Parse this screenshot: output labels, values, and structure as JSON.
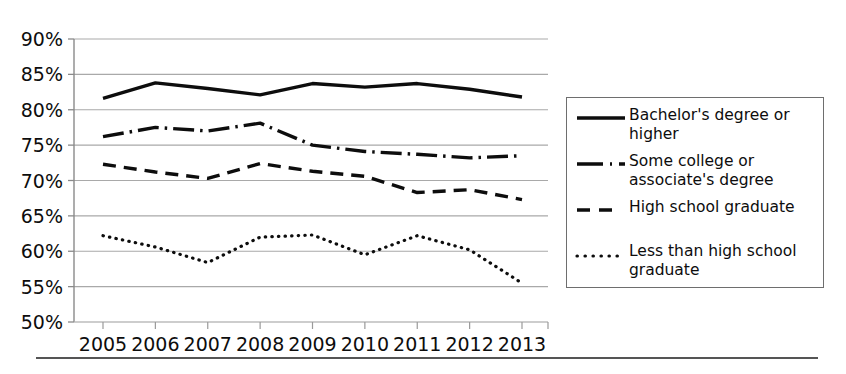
{
  "chart_data": {
    "type": "line",
    "title": "",
    "xlabel": "",
    "ylabel": "",
    "grid": true,
    "legend_position": "right",
    "ylim": [
      50,
      90
    ],
    "ytick_step": 5,
    "categories": [
      "2005",
      "2006",
      "2007",
      "2008",
      "2009",
      "2010",
      "2011",
      "2012",
      "2013"
    ],
    "x": [
      2005,
      2006,
      2007,
      2008,
      2009,
      2010,
      2011,
      2012,
      2013
    ],
    "ytick_labels": [
      "90%",
      "85%",
      "80%",
      "75%",
      "70%",
      "65%",
      "60%",
      "55%",
      "50%"
    ],
    "ytick_values": [
      90,
      85,
      80,
      75,
      70,
      65,
      60,
      55,
      50
    ],
    "series": [
      {
        "name": "Bachelor's degree or higher",
        "style": "solid",
        "color": "#0d0d0d",
        "values": [
          81.6,
          83.8,
          83.0,
          82.1,
          83.7,
          83.2,
          83.7,
          82.9,
          81.8
        ]
      },
      {
        "name": "Some college or associate's degree",
        "style": "dash-dot",
        "color": "#0d0d0d",
        "values": [
          76.2,
          77.5,
          77.0,
          78.1,
          75.0,
          74.1,
          73.7,
          73.2,
          73.5
        ]
      },
      {
        "name": "High school graduate",
        "style": "dashed",
        "color": "#0d0d0d",
        "values": [
          72.3,
          71.2,
          70.3,
          72.4,
          71.3,
          70.6,
          68.3,
          68.7,
          67.3
        ]
      },
      {
        "name": "Less than high school graduate",
        "style": "dotted",
        "color": "#0d0d0d",
        "values": [
          62.2,
          60.6,
          58.4,
          62.0,
          62.3,
          59.5,
          62.2,
          60.2,
          55.5
        ]
      }
    ]
  },
  "legend": {
    "items": [
      {
        "label_line1": "Bachelor's degree or",
        "label_line2": "higher",
        "style": "solid"
      },
      {
        "label_line1": "Some college or",
        "label_line2": "associate's degree",
        "style": "dash-dot"
      },
      {
        "label_line1": "High school graduate",
        "label_line2": "",
        "style": "dashed"
      },
      {
        "label_line1": "Less than high school",
        "label_line2": "graduate",
        "style": "dotted"
      }
    ]
  }
}
